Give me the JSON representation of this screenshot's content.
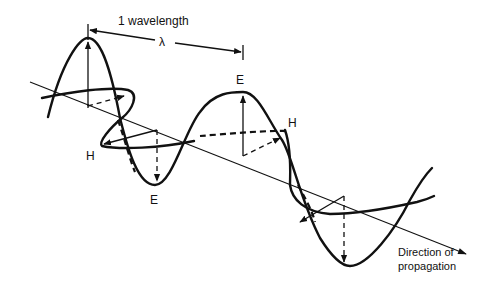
{
  "diagram": {
    "wavelength_label": "1 wavelength",
    "lambda_symbol": "λ",
    "field_labels": {
      "e_top": "E",
      "h_right": "H",
      "h_left": "H",
      "e_bottom": "E"
    },
    "direction_label_line1": "Direction of",
    "direction_label_line2": "propagation",
    "colors": {
      "ink": "#111111",
      "background": "#ffffff"
    }
  }
}
